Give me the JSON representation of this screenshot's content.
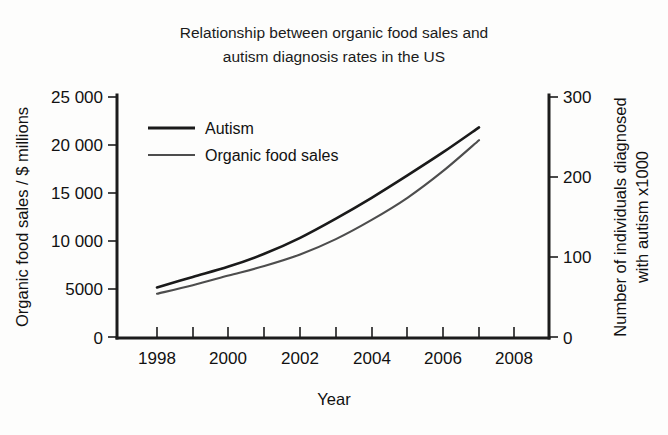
{
  "chart_data": {
    "type": "line",
    "title": "Relationship between organic food sales and autism diagnosis rates in the US",
    "title_line1": "Relationship between organic food sales and",
    "title_line2": "autism diagnosis rates in the US",
    "xlabel": "Year",
    "ylabel_left": "Organic food sales / $ millions",
    "ylabel_right_line1": "Number of individuals diagnosed",
    "ylabel_right_line2": "with autism x1000",
    "grid": false,
    "legend_position": "upper-left-inside",
    "xlim": [
      1997.5,
      2008.5
    ],
    "x_ticks": [
      1998,
      1999,
      2000,
      2001,
      2002,
      2003,
      2004,
      2005,
      2006,
      2007,
      2008
    ],
    "x_tick_labels": [
      "1998",
      "",
      "2000",
      "",
      "2002",
      "",
      "2004",
      "",
      "2006",
      "",
      "2008"
    ],
    "x_tick_labels_shown": [
      "1998",
      "2000",
      "2002",
      "2004",
      "2006",
      "2008"
    ],
    "ylim_left": [
      0,
      25000
    ],
    "y_ticks_left": [
      0,
      5000,
      10000,
      15000,
      20000,
      25000
    ],
    "y_tick_labels_left": [
      "0",
      "5000",
      "10 000",
      "15 000",
      "20 000",
      "25 000"
    ],
    "ylim_right": [
      0,
      300
    ],
    "y_ticks_right": [
      0,
      100,
      200,
      300
    ],
    "y_tick_labels_right": [
      "0",
      "100",
      "200",
      "300"
    ],
    "x": [
      1998,
      1999,
      2000,
      2001,
      2002,
      2003,
      2004,
      2005,
      2006,
      2007
    ],
    "series": [
      {
        "name": "Autism",
        "axis": "right",
        "units": "individuals diagnosed x1000",
        "color": "#1a1a1a",
        "values": [
          62,
          75,
          88,
          104,
          124,
          148,
          174,
          202,
          231,
          262
        ]
      },
      {
        "name": "Organic food sales",
        "axis": "left",
        "units": "$ millions",
        "color": "#4d4d4d",
        "values": [
          4500,
          5400,
          6400,
          7400,
          8600,
          10200,
          12200,
          14500,
          17300,
          20500
        ]
      }
    ],
    "legend_entries": [
      "Autism",
      "Organic food sales"
    ]
  }
}
